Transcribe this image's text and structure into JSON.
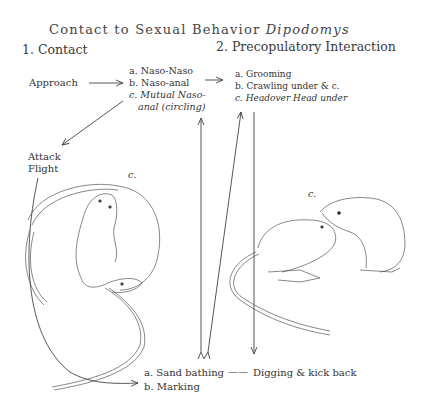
{
  "title": {
    "main": "Contact   to   Sexual   Behavior",
    "genus": "Dipodomys"
  },
  "sections": {
    "contact": {
      "heading": "1. Contact",
      "approach": "Approach",
      "items": [
        {
          "label": "a. Naso-Naso"
        },
        {
          "label": "b. Naso-anal"
        },
        {
          "label": "c. Mutual Naso-"
        },
        {
          "label": "anal (circling)"
        }
      ],
      "outcome_1": "Attack",
      "outcome_2": "Flight"
    },
    "precopulatory": {
      "heading": "2.  Precopulatory Interaction",
      "items": [
        {
          "label": "a. Grooming"
        },
        {
          "label": "b. Crawling under &  c."
        },
        {
          "label": "c. Headover  Head under"
        }
      ]
    },
    "other": {
      "items": [
        {
          "label": "a. Sand bathing"
        },
        {
          "label": "b. Marking"
        }
      ],
      "linked": "Digging & kick back",
      "connector": "——"
    }
  },
  "figure_labels": {
    "left_figure": "c.",
    "right_figure": "c."
  },
  "colors": {
    "ink": "#3a3a3a",
    "background": "#ffffff"
  }
}
